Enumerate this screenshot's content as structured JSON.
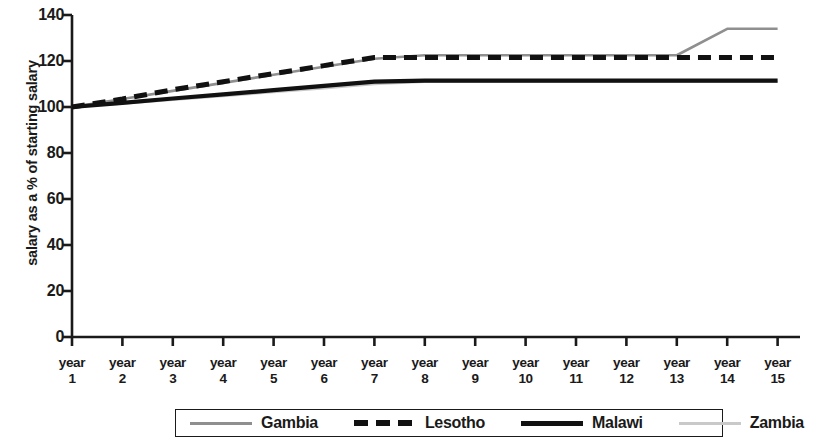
{
  "chart_data": {
    "type": "line",
    "title": "",
    "xlabel": "",
    "ylabel": "salary as a % of starting salary",
    "categories": [
      "year 1",
      "year 2",
      "year 3",
      "year 4",
      "year 5",
      "year 6",
      "year 7",
      "year 8",
      "year 9",
      "year 10",
      "year 11",
      "year 12",
      "year 13",
      "year 14",
      "year 15"
    ],
    "x_tick_lines": [
      [
        "year",
        "1"
      ],
      [
        "year",
        "2"
      ],
      [
        "year",
        "3"
      ],
      [
        "year",
        "4"
      ],
      [
        "year",
        "5"
      ],
      [
        "year",
        "6"
      ],
      [
        "year",
        "7"
      ],
      [
        "year",
        "8"
      ],
      [
        "year",
        "9"
      ],
      [
        "year",
        "10"
      ],
      [
        "year",
        "11"
      ],
      [
        "year",
        "12"
      ],
      [
        "year",
        "13"
      ],
      [
        "year",
        "14"
      ],
      [
        "year",
        "15"
      ]
    ],
    "ylim": [
      0,
      140
    ],
    "yticks": [
      0,
      20,
      40,
      60,
      80,
      100,
      120,
      140
    ],
    "ytick_labels": [
      "0",
      "20",
      "40",
      "60",
      "80",
      "100",
      "120",
      "140"
    ],
    "grid": false,
    "legend_position": "bottom",
    "series": [
      {
        "name": "Gambia",
        "color": "#8f8f8f",
        "style": "solid-thin",
        "values": [
          100,
          103.5,
          107,
          110.5,
          114,
          117.5,
          121,
          122.5,
          122.5,
          122.5,
          122.5,
          122.5,
          122.5,
          134,
          134
        ]
      },
      {
        "name": "Lesotho",
        "color": "#111111",
        "style": "dashed",
        "values": [
          100,
          103.5,
          107.5,
          111,
          114.5,
          118,
          121.5,
          121.5,
          121.5,
          121.5,
          121.5,
          121.5,
          121.5,
          121.5,
          121.5
        ]
      },
      {
        "name": "Malawi",
        "color": "#111111",
        "style": "solid-thick",
        "values": [
          100,
          101.8,
          103.7,
          105.5,
          107.3,
          109.2,
          111,
          111.5,
          111.5,
          111.5,
          111.5,
          111.5,
          111.5,
          111.5,
          111.5
        ]
      },
      {
        "name": "Zambia",
        "color": "#c9c9c9",
        "style": "solid-thin",
        "values": [
          100,
          101.5,
          103.2,
          104.8,
          106.5,
          108.2,
          110,
          111,
          111,
          111,
          111,
          111,
          111,
          111,
          111
        ]
      }
    ]
  },
  "legend": {
    "items": [
      {
        "label": "Gambia"
      },
      {
        "label": "Lesotho"
      },
      {
        "label": "Malawi"
      },
      {
        "label": "Zambia"
      }
    ]
  },
  "axis": {
    "y_title": "salary as a % of starting salary"
  }
}
